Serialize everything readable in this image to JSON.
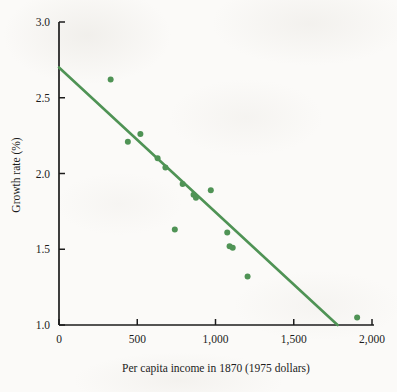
{
  "figure": {
    "background_color": "#fbfaf8",
    "accent_color": "#4f9355",
    "axis_color": "#1c1c1c"
  },
  "chart_data": {
    "type": "scatter",
    "title": "",
    "subtitle": "",
    "xlabel": "Per capita income in 1870 (1975 dollars)",
    "ylabel": "Growth rate (%)",
    "xlim": [
      0,
      2000
    ],
    "ylim": [
      1.0,
      3.0
    ],
    "xticks": [
      0,
      500,
      1000,
      1500,
      2000
    ],
    "xtick_labels": [
      "0",
      "500",
      "1,000",
      "1,500",
      "2,000"
    ],
    "yticks": [
      1.0,
      1.5,
      2.0,
      2.5,
      3.0
    ],
    "ytick_labels": [
      "1.0",
      "1.5",
      "2.0",
      "2.5",
      "3.0"
    ],
    "grid": false,
    "legend": null,
    "marker_color": "#4f9355",
    "marker_size": 6,
    "series": [
      {
        "name": "Countries",
        "type": "scatter",
        "points": [
          {
            "x": 330,
            "y": 2.62
          },
          {
            "x": 440,
            "y": 2.21
          },
          {
            "x": 520,
            "y": 2.26
          },
          {
            "x": 630,
            "y": 2.1
          },
          {
            "x": 680,
            "y": 2.04
          },
          {
            "x": 740,
            "y": 1.63
          },
          {
            "x": 790,
            "y": 1.93
          },
          {
            "x": 860,
            "y": 1.86
          },
          {
            "x": 875,
            "y": 1.84
          },
          {
            "x": 970,
            "y": 1.89
          },
          {
            "x": 1075,
            "y": 1.61
          },
          {
            "x": 1090,
            "y": 1.52
          },
          {
            "x": 1110,
            "y": 1.51
          },
          {
            "x": 1205,
            "y": 1.32
          },
          {
            "x": 1905,
            "y": 1.05
          }
        ]
      },
      {
        "name": "Regression line",
        "type": "line",
        "points": [
          {
            "x": 0,
            "y": 2.7
          },
          {
            "x": 1780,
            "y": 1.0
          }
        ],
        "color": "#4f9355",
        "width": 2.6
      }
    ]
  }
}
